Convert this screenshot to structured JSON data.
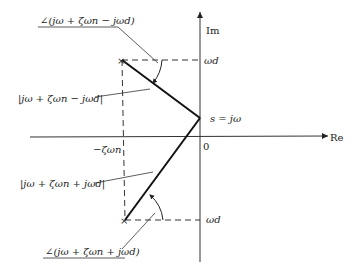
{
  "diagram": {
    "type": "s-plane vector diagram",
    "axes": {
      "imag_label": "Im",
      "real_label": "Re",
      "origin_label": "0"
    },
    "points": {
      "test_point_label": "s = jω",
      "upper_pole_marker": "×",
      "lower_pole_marker": "×"
    },
    "ticks": {
      "omega_d_upper": "ωd",
      "omega_d_lower": "ωd",
      "neg_zeta_omega_n": "−ζωn"
    },
    "labels": {
      "angle_upper": "∠(jω + ζωn − jωd)",
      "magnitude_upper": "|jω + ζωn − jωd|",
      "magnitude_lower": "|jω + ζωn + jωd|",
      "angle_lower": "∠(jω + ζωn + jωd)"
    }
  }
}
